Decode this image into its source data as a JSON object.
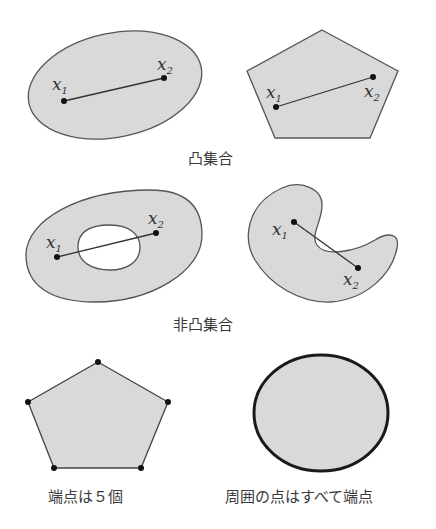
{
  "colors": {
    "fill": "#d9d9d9",
    "stroke": "#555555",
    "point": "#111111",
    "text": "#333333",
    "thick_stroke": "#1a1a1a"
  },
  "panels": {
    "convex_ellipse": {
      "p1": "x1",
      "p2": "x2",
      "p1_label": "x",
      "p1_sub": "1",
      "p2_label": "x",
      "p2_sub": "2"
    },
    "convex_pentagon": {
      "p1_label": "x",
      "p1_sub": "1",
      "p2_label": "x",
      "p2_sub": "2"
    },
    "nonconvex_annulus": {
      "p1_label": "x",
      "p1_sub": "1",
      "p2_label": "x",
      "p2_sub": "2"
    },
    "nonconvex_crescent": {
      "p1_label": "x",
      "p1_sub": "1",
      "p2_label": "x",
      "p2_sub": "2"
    },
    "extreme_pentagon": {
      "vertex_count": 5
    },
    "extreme_circle": {}
  },
  "captions": {
    "convex": "凸集合",
    "nonconvex": "非凸集合",
    "pentagon_extreme": "端点は５個",
    "circle_extreme": "周囲の点はすべて端点"
  }
}
